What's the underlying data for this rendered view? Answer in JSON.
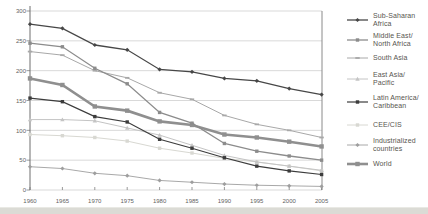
{
  "chart_data": {
    "type": "line",
    "title": "",
    "xlabel": "",
    "ylabel": "",
    "x": [
      1960,
      1965,
      1970,
      1975,
      1980,
      1985,
      1990,
      1995,
      2000,
      2005
    ],
    "ylim": [
      0,
      300
    ],
    "yticks": [
      0,
      50,
      100,
      150,
      200,
      250,
      300
    ],
    "grid": true,
    "legend_position": "right",
    "series": [
      {
        "name": "Sub-Saharan Africa",
        "legend_lines": [
          "Sub-Saharan",
          "Africa"
        ],
        "values": [
          278,
          271,
          243,
          235,
          202,
          198,
          187,
          183,
          170,
          160
        ],
        "color": "#474747",
        "marker": "diamond",
        "width": 1.3
      },
      {
        "name": "Middle East/North Africa",
        "legend_lines": [
          "Middle East/",
          "North Africa"
        ],
        "values": [
          246,
          240,
          204,
          178,
          130,
          112,
          78,
          65,
          57,
          50
        ],
        "color": "#8c8c8c",
        "marker": "square",
        "width": 1.3
      },
      {
        "name": "South Asia",
        "legend_lines": [
          "South Asia"
        ],
        "values": [
          232,
          226,
          200,
          188,
          163,
          152,
          125,
          110,
          100,
          88
        ],
        "color": "#a8a8a8",
        "marker": "dash",
        "width": 1
      },
      {
        "name": "East Asia/Pacific",
        "legend_lines": [
          "East Asia/",
          "Pacific"
        ],
        "values": [
          118,
          118,
          116,
          104,
          92,
          75,
          58,
          47,
          40,
          33
        ],
        "color": "#c4c4c4",
        "marker": "triangle",
        "width": 1
      },
      {
        "name": "Latin America/Caribbean",
        "legend_lines": [
          "Latin America/",
          "Caribbean"
        ],
        "values": [
          154,
          148,
          123,
          114,
          85,
          70,
          54,
          40,
          32,
          26
        ],
        "color": "#3c3c3c",
        "marker": "square",
        "width": 1.2
      },
      {
        "name": "CEE/CIS",
        "legend_lines": [
          "CEE/CIS"
        ],
        "values": [
          93,
          91,
          88,
          82,
          70,
          62,
          53,
          47,
          40,
          32
        ],
        "color": "#d8d8d2",
        "marker": "square",
        "width": 1
      },
      {
        "name": "Industrialized countries",
        "legend_lines": [
          "Industrialized",
          "countries"
        ],
        "values": [
          39,
          36,
          28,
          24,
          16,
          13,
          10,
          8,
          7,
          6
        ],
        "color": "#9e9e9e",
        "marker": "diamond",
        "width": 0.9
      },
      {
        "name": "World",
        "legend_lines": [
          "World"
        ],
        "values": [
          187,
          176,
          140,
          133,
          115,
          109,
          93,
          88,
          81,
          73
        ],
        "color": "#8f8f8f",
        "marker": "square",
        "width": 2.6
      }
    ]
  },
  "colors": {
    "gridline": "#c9c9c9",
    "axis": "#6e6e6e",
    "plot_right_border": "#8a8a8a",
    "tick_label": "#5f5f5f",
    "legend_text": "#57554f",
    "bottom_band": "#dbdbd5"
  }
}
